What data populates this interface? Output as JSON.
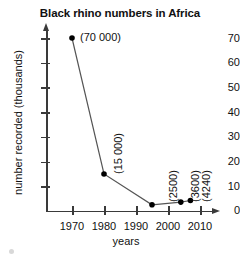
{
  "chart_data": {
    "type": "line",
    "title": "Black rhino numbers in Africa",
    "xlabel": "years",
    "ylabel": "number recorded (thousands)",
    "xlim": [
      1965,
      2013
    ],
    "ylim": [
      0,
      74
    ],
    "xticks": [
      "1970",
      "1980",
      "1990",
      "2000",
      "2010"
    ],
    "yticks": [
      "0",
      "10",
      "20",
      "30",
      "40",
      "50",
      "60",
      "70"
    ],
    "grid": false,
    "legend": "none",
    "units_note": "y values are in thousands; annotations show absolute counts",
    "x": [
      1970,
      1980,
      1995,
      2004,
      2007
    ],
    "values": [
      70,
      15,
      2.5,
      3.6,
      4.24
    ],
    "point_labels": [
      "(70 000)",
      "(15 000)",
      "(2500)",
      "(3600)",
      "(4240)"
    ],
    "absolute_values": [
      70000,
      15000,
      2500,
      3600,
      4240
    ],
    "marker": "filled-circle",
    "marker_color": "#000000",
    "line_color": "#555555"
  },
  "axes": {
    "y_ticks": [
      {
        "label": "70",
        "value": 70
      },
      {
        "label": "60",
        "value": 60
      },
      {
        "label": "50",
        "value": 50
      },
      {
        "label": "40",
        "value": 40
      },
      {
        "label": "30",
        "value": 30
      },
      {
        "label": "20",
        "value": 20
      },
      {
        "label": "10",
        "value": 10
      },
      {
        "label": "0",
        "value": 0
      }
    ],
    "x_ticks": [
      {
        "label": "1970",
        "value": 1970
      },
      {
        "label": "1980",
        "value": 1980
      },
      {
        "label": "1990",
        "value": 1990
      },
      {
        "label": "2000",
        "value": 2000
      },
      {
        "label": "2010",
        "value": 2010
      }
    ]
  },
  "points": [
    {
      "label": "(70 000)",
      "year": 1970,
      "value": 70,
      "orientation": "horizontal"
    },
    {
      "label": "(15 000)",
      "year": 1980,
      "value": 15,
      "orientation": "vertical"
    },
    {
      "label": "(2500)",
      "year": 1995,
      "value": 2.5,
      "orientation": "vertical"
    },
    {
      "label": "(3600)",
      "year": 2004,
      "value": 3.6,
      "orientation": "vertical"
    },
    {
      "label": "(4240)",
      "year": 2007,
      "value": 4.24,
      "orientation": "vertical"
    }
  ]
}
